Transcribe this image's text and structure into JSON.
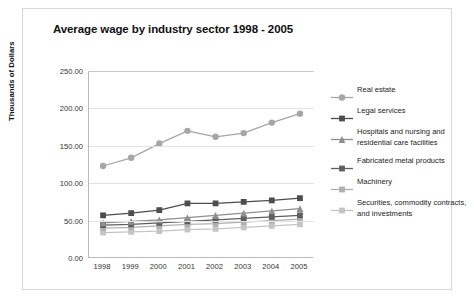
{
  "chart_data": {
    "type": "line",
    "title": "Average wage by industry sector 1998 - 2005",
    "xlabel": "",
    "ylabel": "Thousands of Dollars",
    "categories": [
      "1998",
      "1999",
      "2000",
      "2001",
      "2002",
      "2003",
      "2004",
      "2005"
    ],
    "ylim": [
      0,
      250
    ],
    "yticks": [
      "0.00",
      "50.00",
      "100.00",
      "150.00",
      "200.00",
      "250.00"
    ],
    "ytick_values": [
      0,
      50,
      100,
      150,
      200,
      250
    ],
    "grid": true,
    "legend_position": "right",
    "series": [
      {
        "name": "Real estate",
        "marker": "circle",
        "color": "#a6a6a6",
        "values": [
          123,
          134,
          153,
          170,
          162,
          167,
          181,
          193
        ]
      },
      {
        "name": "Legal services",
        "marker": "square",
        "color": "#4d4d4d",
        "values": [
          57,
          60,
          64,
          73,
          73,
          75,
          77,
          80
        ]
      },
      {
        "name": "Hospitals and nursing and residential care facilities",
        "marker": "triangle",
        "color": "#8f8f8f",
        "values": [
          47,
          49,
          51,
          54,
          57,
          60,
          63,
          66
        ]
      },
      {
        "name": "Fabricated metal products",
        "marker": "square",
        "color": "#5f5f5f",
        "values": [
          44,
          45,
          47,
          49,
          51,
          53,
          55,
          57
        ]
      },
      {
        "name": "Machinery",
        "marker": "square",
        "color": "#b0b0b0",
        "values": [
          40,
          41,
          43,
          45,
          46,
          48,
          50,
          52
        ]
      },
      {
        "name": "Securities, commodity contracts, and investments",
        "marker": "square",
        "color": "#c4c4c4",
        "values": [
          34,
          35,
          36,
          38,
          39,
          41,
          43,
          45
        ]
      }
    ]
  }
}
